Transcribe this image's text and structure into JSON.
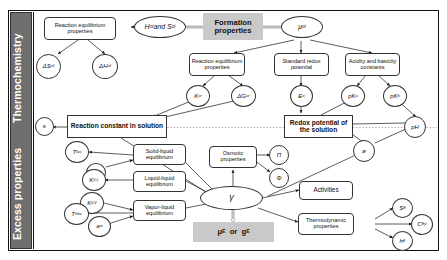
{
  "sidebar": {
    "items": [
      {
        "id": "thermochemistry",
        "label": "Thermochemistry"
      },
      {
        "id": "excess-properties",
        "label": "Excess properties"
      }
    ]
  },
  "nodes": {
    "reaction_equilibrium_properties_left": "Reaction equilibrium properties",
    "delta_s_f": "ΔS°f",
    "delta_h_f": "ΔH°f",
    "h_and_s": "H°i and S°i",
    "formation_properties": "Formation properties",
    "mu_i": "μ°i",
    "reaction_equilibrium_properties_right": "Reaction equilibrium properties",
    "standard_redox_potential": "Standard redox potential",
    "acidity_basicity_constants": "Acidity and basicity constants",
    "k_r": "K°r",
    "delta_g_r": "ΔG°r",
    "e_zero": "E°",
    "pka": "pKa",
    "pkb": "pKb",
    "kappa": "κ",
    "reaction_constant_in_solution": "Reaction constant in solution",
    "redox_potential_of_the_solution": "Redox potential of the solution",
    "ph": "pH",
    "t_fus": "Tfus",
    "delta_i": "δi",
    "k_ll": "KiLL",
    "k_lv": "KiLV",
    "t_ebu": "Tebu",
    "a_w": "aw",
    "solid_liquid_equilibrium": "Solid-liquid equilibrium",
    "liquid_liquid_equilibrium": "Liquid-liquid equilibrium",
    "vapor_liquid_equilibrium": "Vapor-liquid equilibrium",
    "osmotic_properties": "Osmotic properties",
    "pi": "Π",
    "phi": "Φ",
    "gamma": "γ",
    "mu_e_or_g_e": "μE or gE",
    "a_i": "ai",
    "activities": "Activities",
    "thermodynamic_properties": "Thermodynamic properties",
    "s_e": "SE",
    "c_p_e": "CpE",
    "h_e": "hE"
  },
  "colors": {
    "sidebar_fill": "#6e6e6e",
    "sidebar_text": "#ffffff",
    "highlight_fill": "#c9c9c9",
    "stroke": "#333333",
    "frame": "#111111",
    "background": "#ffffff"
  }
}
